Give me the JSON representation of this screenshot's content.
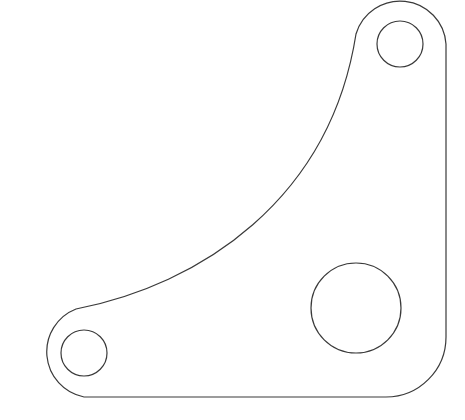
{
  "drawing": {
    "type": "bracket-plate",
    "stroke_color": "#3a3a3a",
    "background": "#ffffff",
    "outline": {
      "description": "L-shaped gusset plate with concave inner arc and rounded lugs"
    },
    "holes": [
      {
        "name": "top-right-hole",
        "cx": 400,
        "cy": 44,
        "r": 23
      },
      {
        "name": "bottom-left-hole",
        "cx": 84,
        "cy": 353,
        "r": 23
      },
      {
        "name": "large-center-hole",
        "cx": 356,
        "cy": 308,
        "r": 45
      }
    ]
  }
}
